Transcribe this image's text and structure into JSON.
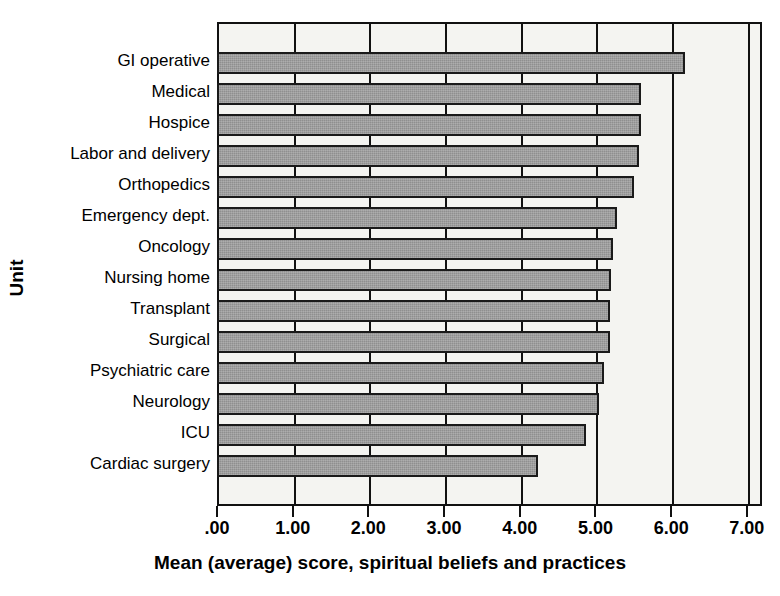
{
  "chart_data": {
    "type": "bar",
    "orientation": "horizontal",
    "title": "",
    "xlabel": "Mean (average) score, spiritual beliefs and practices",
    "ylabel": "Unit",
    "xlim": [
      0,
      7.2
    ],
    "grid": true,
    "legend": "none",
    "bar_color": "#9a9a9a",
    "bar_border_color": "#1a1a1a",
    "plot_background": "#f4f4f1",
    "xticks": [
      0,
      1,
      2,
      3,
      4,
      5,
      6,
      7
    ],
    "xtick_labels": [
      ".00",
      "1.00",
      "2.00",
      "3.00",
      "4.00",
      "5.00",
      "6.00",
      "7.00"
    ],
    "categories": [
      "GI operative",
      "Medical",
      "Hospice",
      "Labor and delivery",
      "Orthopedics",
      "Emergency dept.",
      "Oncology",
      "Nursing home",
      "Transplant",
      "Surgical",
      "Psychiatric care",
      "Neurology",
      "ICU",
      "Cardiac surgery"
    ],
    "values": [
      6.15,
      5.58,
      5.57,
      5.55,
      5.48,
      5.26,
      5.2,
      5.18,
      5.17,
      5.16,
      5.08,
      5.02,
      4.85,
      4.22
    ]
  }
}
